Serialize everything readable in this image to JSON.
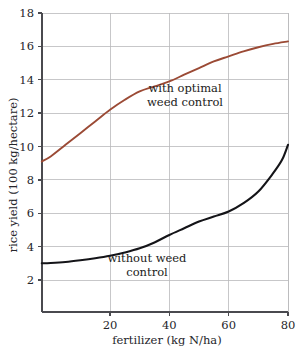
{
  "chart_data": {
    "type": "line",
    "title": "",
    "xlabel": "fertilizer (kg N/ha)",
    "ylabel": "rice yield (100 kg/hectare)",
    "xlim": [
      -3,
      80
    ],
    "ylim": [
      0.4,
      18
    ],
    "xticks": [
      20,
      40,
      60,
      80
    ],
    "yticks": [
      2,
      4,
      6,
      8,
      10,
      12,
      14,
      16,
      18
    ],
    "xtick_labels": [
      "20",
      "40",
      "60",
      "80"
    ],
    "ytick_labels": [
      "2",
      "4",
      "6",
      "8",
      "10",
      "12",
      "14",
      "16",
      "18"
    ],
    "grid": true,
    "grid_horizontal": true,
    "grid_vertical": true,
    "legend": "inline-annotations",
    "series": [
      {
        "name": "with optimal weed control",
        "color": "#9b4a35",
        "width": 1.9,
        "x": [
          -3,
          0,
          5,
          10,
          15,
          20,
          25,
          30,
          35,
          40,
          45,
          50,
          55,
          60,
          65,
          70,
          75,
          80
        ],
        "values": [
          9.1,
          9.4,
          10.1,
          10.8,
          11.5,
          12.2,
          12.8,
          13.3,
          13.6,
          13.9,
          14.3,
          14.7,
          15.1,
          15.4,
          15.7,
          15.95,
          16.15,
          16.3
        ]
      },
      {
        "name": "without weed control",
        "color": "#141418",
        "width": 2.1,
        "x": [
          -3,
          0,
          5,
          10,
          15,
          20,
          25,
          30,
          35,
          40,
          45,
          50,
          55,
          60,
          65,
          70,
          75,
          78,
          80
        ],
        "values": [
          3.0,
          3.02,
          3.08,
          3.18,
          3.3,
          3.45,
          3.65,
          3.9,
          4.25,
          4.7,
          5.1,
          5.5,
          5.8,
          6.1,
          6.6,
          7.3,
          8.4,
          9.2,
          10.1
        ]
      }
    ],
    "annotations": [
      {
        "id": "upper-annotation",
        "lines": [
          "with optimal",
          "weed control"
        ],
        "x_px": 185,
        "y_px": 92
      },
      {
        "id": "lower-annotation",
        "lines": [
          "without weed",
          "control"
        ],
        "x_px": 147,
        "y_px": 262
      }
    ]
  }
}
